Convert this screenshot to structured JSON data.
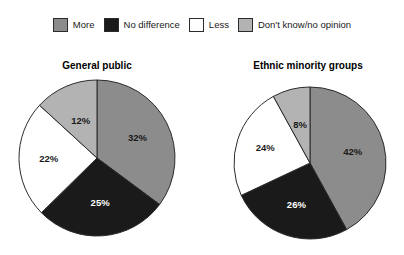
{
  "legend": {
    "items": [
      {
        "label": "More",
        "color": "#8c8c8c",
        "swatch": "legend-swatch-more"
      },
      {
        "label": "No difference",
        "color": "#1a1a1a",
        "swatch": "legend-swatch-no-difference"
      },
      {
        "label": "Less",
        "color": "#ffffff",
        "swatch": "legend-swatch-less"
      },
      {
        "label": "Don't know/no opinion",
        "color": "#b3b3b3",
        "swatch": "legend-swatch-dont-know"
      }
    ]
  },
  "charts": [
    {
      "title": "General public",
      "labels": [
        "32%",
        "25%",
        "22%",
        "12%"
      ]
    },
    {
      "title": "Ethnic minority groups",
      "labels": [
        "42%",
        "26%",
        "24%",
        "8%"
      ]
    }
  ],
  "chart_data": [
    {
      "type": "pie",
      "title": "General public",
      "categories": [
        "More",
        "No difference",
        "Less",
        "Don't know/no opinion"
      ],
      "values": [
        32,
        25,
        22,
        12
      ],
      "value_labels": [
        "32%",
        "25%",
        "22%",
        "12%"
      ],
      "colors": [
        "#8c8c8c",
        "#1a1a1a",
        "#ffffff",
        "#b3b3b3"
      ],
      "unit": "percent",
      "start_angle_deg": 0,
      "direction": "clockwise",
      "legend_position": "top"
    },
    {
      "type": "pie",
      "title": "Ethnic minority groups",
      "categories": [
        "More",
        "No difference",
        "Less",
        "Don't know/no opinion"
      ],
      "values": [
        42,
        26,
        24,
        8
      ],
      "value_labels": [
        "42%",
        "26%",
        "24%",
        "8%"
      ],
      "colors": [
        "#8c8c8c",
        "#1a1a1a",
        "#ffffff",
        "#b3b3b3"
      ],
      "unit": "percent",
      "start_angle_deg": 0,
      "direction": "clockwise",
      "legend_position": "top"
    }
  ]
}
